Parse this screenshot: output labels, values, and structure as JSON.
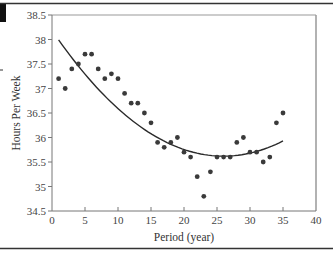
{
  "chart_data": {
    "type": "scatter",
    "title": "",
    "xlabel": "Period (year)",
    "ylabel": "Hours Per Week",
    "xlim": [
      0,
      40
    ],
    "ylim": [
      34.5,
      38.5
    ],
    "x_ticks": [
      0,
      5,
      10,
      15,
      20,
      25,
      30,
      35,
      40
    ],
    "y_ticks": [
      34.5,
      35,
      35.5,
      36,
      36.5,
      37,
      37.5,
      38,
      38.5
    ],
    "x_tick_labels": [
      "0",
      "5",
      "10",
      "15",
      "20",
      "25",
      "30",
      "35",
      "40"
    ],
    "y_tick_labels": [
      "34.5",
      "35",
      "35.5",
      "36",
      "36.5",
      "37",
      "37.5",
      "38",
      "38.5"
    ],
    "grid": false,
    "legend": null,
    "series": [
      {
        "name": "Observed hours",
        "type": "scatter",
        "x": [
          1,
          2,
          3,
          4,
          5,
          6,
          7,
          8,
          9,
          10,
          11,
          12,
          13,
          14,
          15,
          16,
          17,
          18,
          19,
          20,
          21,
          22,
          23,
          24,
          25,
          26,
          27,
          28,
          29,
          30,
          31,
          32,
          33,
          34,
          35
        ],
        "y": [
          37.2,
          37.0,
          37.4,
          37.5,
          37.7,
          37.7,
          37.4,
          37.2,
          37.3,
          37.2,
          36.9,
          36.7,
          36.7,
          36.5,
          36.3,
          35.9,
          35.8,
          35.9,
          36.0,
          35.7,
          35.6,
          35.2,
          34.8,
          35.3,
          35.6,
          35.6,
          35.6,
          35.9,
          36.0,
          35.7,
          35.7,
          35.5,
          35.6,
          36.3,
          36.5
        ]
      },
      {
        "name": "Quadratic trend",
        "type": "line",
        "x": [
          1,
          5,
          10,
          15,
          20,
          25,
          30,
          35
        ],
        "y": [
          38.0,
          37.28,
          36.59,
          36.08,
          35.76,
          35.62,
          35.68,
          35.93
        ]
      }
    ]
  },
  "colors": {
    "points": "#3a3a3a",
    "curve": "#2a2a2a",
    "axis": "#777777",
    "rule": "#333333"
  }
}
